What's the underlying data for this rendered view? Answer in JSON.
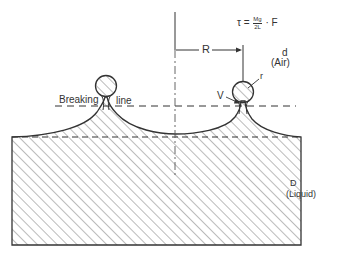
{
  "figure": {
    "formula": {
      "lhs": "τ =",
      "numerator": "Mg",
      "denominator": "2L",
      "rhs": "· F"
    },
    "labels": {
      "radius_R": "R",
      "air_symbol": "d",
      "air_name": "(Air)",
      "drop_radius": "r",
      "neck_volume": "V",
      "breaking_word1": "Breaking",
      "breaking_word2": "line",
      "liquid_symbol": "D",
      "liquid_name": "(Liquid)"
    },
    "colors": {
      "stroke": "#333333",
      "hatch": "#666666",
      "background": "#ffffff"
    }
  }
}
